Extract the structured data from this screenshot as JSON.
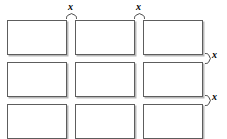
{
  "diagram": {
    "canvas": {
      "width": 227,
      "height": 139,
      "background": "#ffffff"
    },
    "style": {
      "cell_fill": "#ffffff",
      "cell_border": "#5d5d5d",
      "cell_shadow": "#b9b9b9",
      "label_color": "#000000",
      "brace_color": "#2b2b2b"
    },
    "grid": {
      "rows": 3,
      "columns": 3,
      "cell_width": 60,
      "cell_height": 35,
      "column_gap": 8,
      "row_gap": 7,
      "origin_x": 7,
      "origin_y": 20
    },
    "cells": [
      {
        "row": 1,
        "column": 1,
        "x": 7,
        "y": 20,
        "width": 60,
        "height": 35,
        "label": ""
      },
      {
        "row": 1,
        "column": 2,
        "x": 75,
        "y": 20,
        "width": 60,
        "height": 35,
        "label": ""
      },
      {
        "row": 1,
        "column": 3,
        "x": 143,
        "y": 20,
        "width": 60,
        "height": 35,
        "label": ""
      },
      {
        "row": 2,
        "column": 1,
        "x": 7,
        "y": 62,
        "width": 60,
        "height": 35,
        "label": ""
      },
      {
        "row": 2,
        "column": 2,
        "x": 75,
        "y": 62,
        "width": 60,
        "height": 35,
        "label": ""
      },
      {
        "row": 2,
        "column": 3,
        "x": 143,
        "y": 62,
        "width": 60,
        "height": 35,
        "label": ""
      },
      {
        "row": 3,
        "column": 1,
        "x": 7,
        "y": 104,
        "width": 60,
        "height": 35,
        "label": ""
      },
      {
        "row": 3,
        "column": 2,
        "x": 75,
        "y": 104,
        "width": 60,
        "height": 35,
        "label": ""
      },
      {
        "row": 3,
        "column": 3,
        "x": 143,
        "y": 104,
        "width": 60,
        "height": 35,
        "label": ""
      }
    ],
    "annotations": [
      {
        "id": "gap-columns-1-2",
        "text": "x",
        "orientation": "horizontal",
        "position": "top",
        "brace_x": 66,
        "brace_y": 14,
        "brace_span": 10,
        "label_x": 68,
        "label_y": 3
      },
      {
        "id": "gap-columns-2-3",
        "text": "x",
        "orientation": "horizontal",
        "position": "top",
        "brace_x": 134,
        "brace_y": 14,
        "brace_span": 10,
        "label_x": 136,
        "label_y": 3
      },
      {
        "id": "gap-rows-1-2",
        "text": "x",
        "orientation": "vertical",
        "position": "right",
        "brace_x": 205,
        "brace_y": 54,
        "brace_span": 9,
        "label_x": 213,
        "label_y": 54
      },
      {
        "id": "gap-rows-2-3",
        "text": "x",
        "orientation": "vertical",
        "position": "right",
        "brace_x": 205,
        "brace_y": 96,
        "brace_span": 9,
        "label_x": 213,
        "label_y": 96
      }
    ]
  }
}
